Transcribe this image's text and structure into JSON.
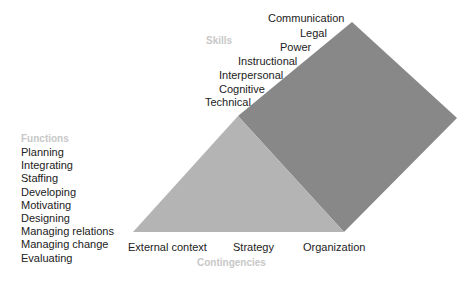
{
  "colors": {
    "triangle": "#b4b4b4",
    "parallelogram": "#888888",
    "header": "#c8c8c8"
  },
  "functions": {
    "title": "Functions",
    "items": [
      "Planning",
      "Integrating",
      "Staffing",
      "Developing",
      "Motivating",
      "Designing",
      "Managing relations",
      "Managing change",
      "Evaluating"
    ]
  },
  "skills": {
    "title": "Skills",
    "items": [
      "Communication",
      "Legal",
      "Power",
      "Instructional",
      "Interpersonal",
      "Cognitive",
      "Technical"
    ]
  },
  "contingencies": {
    "title": "Contingencies",
    "items": [
      "External context",
      "Strategy",
      "Organization"
    ]
  }
}
